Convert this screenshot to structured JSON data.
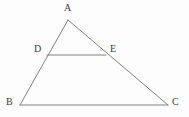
{
  "figure": {
    "type": "geometry-diagram",
    "width": 189,
    "height": 117,
    "background_color": "#fdfdfd",
    "stroke_color": "#808080",
    "label_color": "#3a3a3a",
    "stroke_width": 1
  },
  "points": [
    {
      "name": "A",
      "label": "A",
      "x": 68,
      "y": 20,
      "label_x": 64,
      "label_y": 3
    },
    {
      "name": "B",
      "label": "B",
      "x": 20,
      "y": 105,
      "label_x": 6,
      "label_y": 97
    },
    {
      "name": "C",
      "label": "C",
      "x": 168,
      "y": 105,
      "label_x": 172,
      "label_y": 97
    },
    {
      "name": "D",
      "label": "D",
      "x": 47,
      "y": 55,
      "label_x": 34,
      "label_y": 44
    },
    {
      "name": "E",
      "label": "E",
      "x": 106,
      "y": 55,
      "label_x": 110,
      "label_y": 44
    }
  ],
  "segments": [
    {
      "name": "side-AB",
      "from": "A",
      "to": "B",
      "x1": 68,
      "y1": 20,
      "x2": 20,
      "y2": 105
    },
    {
      "name": "side-AC",
      "from": "A",
      "to": "C",
      "x1": 68,
      "y1": 20,
      "x2": 168,
      "y2": 105
    },
    {
      "name": "side-BC",
      "from": "B",
      "to": "C",
      "x1": 20,
      "y1": 105,
      "x2": 168,
      "y2": 105
    },
    {
      "name": "segment-DE",
      "from": "D",
      "to": "E",
      "x1": 47,
      "y1": 55,
      "x2": 106,
      "y2": 55
    }
  ]
}
